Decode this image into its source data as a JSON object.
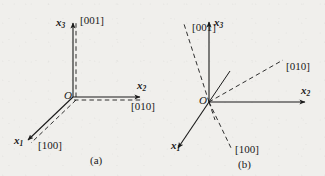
{
  "figure": {
    "background_color": "#f0efec",
    "ink_color": "#1a1a1a",
    "panels": [
      {
        "id": "a",
        "caption": "(a)",
        "origin_label": "O",
        "axes": [
          {
            "name": "x3-axis",
            "label": "x",
            "subscript": "3",
            "style": "solid",
            "direction": "up"
          },
          {
            "name": "x2-axis",
            "label": "x",
            "subscript": "2",
            "style": "solid",
            "direction": "right"
          },
          {
            "name": "x1-axis",
            "label": "x",
            "subscript": "1",
            "style": "solid",
            "direction": "down-left"
          }
        ],
        "directions": [
          {
            "name": "direction-001",
            "label": "[001]",
            "style": "dashed",
            "aligned_with": "x3"
          },
          {
            "name": "direction-010",
            "label": "[010]",
            "style": "dashed",
            "aligned_with": "x2"
          },
          {
            "name": "direction-100",
            "label": "[100]",
            "style": "dashed",
            "aligned_with": "x1"
          }
        ]
      },
      {
        "id": "b",
        "caption": "(b)",
        "origin_label": "O",
        "axes": [
          {
            "name": "x3-axis",
            "label": "x",
            "subscript": "3",
            "style": "solid",
            "direction": "up"
          },
          {
            "name": "x2-axis",
            "label": "x",
            "subscript": "2",
            "style": "solid",
            "direction": "right"
          },
          {
            "name": "x1-axis",
            "label": "x",
            "subscript": "1",
            "style": "solid",
            "direction": "down-left"
          }
        ],
        "directions": [
          {
            "name": "direction-001",
            "label": "[001]",
            "style": "dashed",
            "aligned_with": "none"
          },
          {
            "name": "direction-010",
            "label": "[010]",
            "style": "dashed",
            "aligned_with": "none"
          },
          {
            "name": "direction-100",
            "label": "[100]",
            "style": "dashed",
            "aligned_with": "none"
          }
        ]
      }
    ]
  }
}
